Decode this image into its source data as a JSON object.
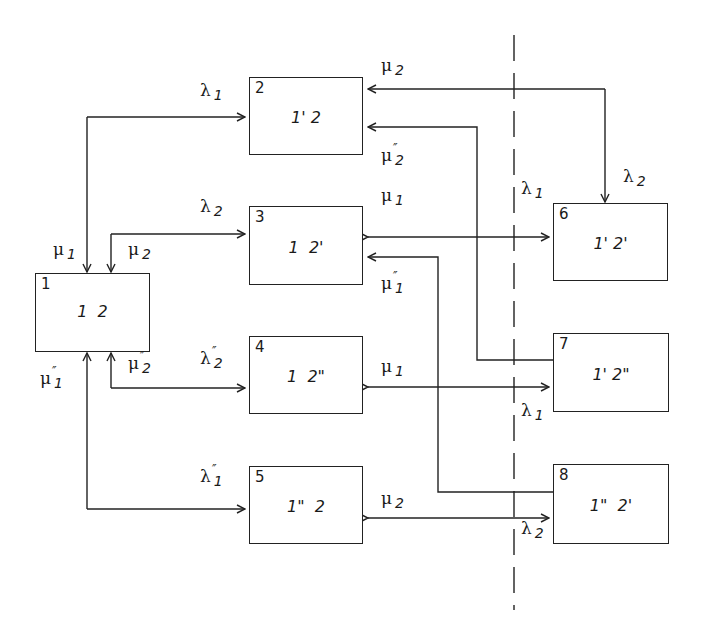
{
  "diagram": {
    "type": "state-transition",
    "states": [
      {
        "id": "1",
        "label": "1  2",
        "x": 35,
        "y": 273,
        "w": 115,
        "h": 79
      },
      {
        "id": "2",
        "label": "1' 2",
        "x": 249,
        "y": 77,
        "w": 114,
        "h": 78
      },
      {
        "id": "3",
        "label": "1  2'",
        "x": 249,
        "y": 206,
        "w": 114,
        "h": 79
      },
      {
        "id": "4",
        "label": "1  2\"",
        "x": 249,
        "y": 336,
        "w": 114,
        "h": 78
      },
      {
        "id": "5",
        "label": "1\"  2",
        "x": 249,
        "y": 466,
        "w": 114,
        "h": 78
      },
      {
        "id": "6",
        "label": "1' 2'",
        "x": 553,
        "y": 203,
        "w": 115,
        "h": 78
      },
      {
        "id": "7",
        "label": "1' 2\"",
        "x": 553,
        "y": 333,
        "w": 116,
        "h": 79
      },
      {
        "id": "8",
        "label": "1\"  2'",
        "x": 553,
        "y": 464,
        "w": 116,
        "h": 80
      }
    ],
    "rates": [
      {
        "name": "lambda1-1to2",
        "sym": "λ",
        "sub": "1",
        "prime": "",
        "x": 200,
        "y": 82
      },
      {
        "name": "lambda2-1to3",
        "sym": "λ",
        "sub": "2",
        "prime": "",
        "x": 200,
        "y": 198
      },
      {
        "name": "lambda2pp-1to4",
        "sym": "λ",
        "sub": "2",
        "prime": "″",
        "x": 200,
        "y": 350
      },
      {
        "name": "lambda1pp-1to5",
        "sym": "λ",
        "sub": "1",
        "prime": "″",
        "x": 200,
        "y": 468
      },
      {
        "name": "mu1-2to1",
        "sym": "μ",
        "sub": "1",
        "prime": "",
        "x": 53,
        "y": 241
      },
      {
        "name": "mu2-3to1",
        "sym": "μ",
        "sub": "2",
        "prime": "",
        "x": 128,
        "y": 241
      },
      {
        "name": "mu2pp-4to1",
        "sym": "μ",
        "sub": "2",
        "prime": "″",
        "x": 128,
        "y": 355
      },
      {
        "name": "mu1pp-5to1",
        "sym": "μ",
        "sub": "1",
        "prime": "″",
        "x": 40,
        "y": 370
      },
      {
        "name": "mu2-6to2",
        "sym": "μ",
        "sub": "2",
        "prime": "",
        "x": 381,
        "y": 57
      },
      {
        "name": "mu2pp-7to2",
        "sym": "μ",
        "sub": "2",
        "prime": "″",
        "x": 381,
        "y": 147
      },
      {
        "name": "mu1-6to3",
        "sym": "μ",
        "sub": "1",
        "prime": "",
        "x": 381,
        "y": 187
      },
      {
        "name": "mu1pp-8to3",
        "sym": "μ",
        "sub": "1",
        "prime": "″",
        "x": 381,
        "y": 275
      },
      {
        "name": "mu1-7to4",
        "sym": "μ",
        "sub": "1",
        "prime": "",
        "x": 381,
        "y": 358
      },
      {
        "name": "mu2-8to5",
        "sym": "μ",
        "sub": "2",
        "prime": "",
        "x": 381,
        "y": 490
      },
      {
        "name": "lambda1-3to6",
        "sym": "λ",
        "sub": "1",
        "prime": "",
        "x": 521,
        "y": 180
      },
      {
        "name": "lambda2-2to6",
        "sym": "λ",
        "sub": "2",
        "prime": "",
        "x": 623,
        "y": 168
      },
      {
        "name": "lambda1-4to7",
        "sym": "λ",
        "sub": "1",
        "prime": "",
        "x": 521,
        "y": 402
      },
      {
        "name": "lambda2-5to8",
        "sym": "λ",
        "sub": "2",
        "prime": "",
        "x": 521,
        "y": 520
      }
    ],
    "separator": {
      "style": "dash-dot",
      "x": 514,
      "y1": 35,
      "y2": 610
    },
    "line_color": "#222222",
    "background": "#ffffff"
  }
}
